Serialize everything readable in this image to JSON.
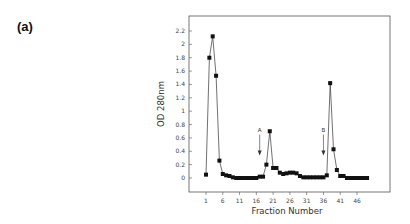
{
  "panel_label": "(a)",
  "chart_data": {
    "type": "line",
    "title": "",
    "xlabel": "Fraction Number",
    "ylabel": "OD 280nm",
    "ylim": [
      0,
      2.2
    ],
    "xlim": [
      1,
      49
    ],
    "grid": false,
    "legend": null,
    "marker": "square",
    "y_ticks": [
      "0",
      "0.2",
      "0.4",
      "0.6",
      "0.8",
      "1",
      "1.2",
      "1.4",
      "1.6",
      "1.8",
      "2",
      "2.2"
    ],
    "x_ticks": [
      "1",
      "6",
      "11",
      "16",
      "21",
      "26",
      "31",
      "36",
      "41",
      "46"
    ],
    "x": [
      1,
      2,
      3,
      4,
      5,
      6,
      7,
      8,
      9,
      10,
      11,
      12,
      13,
      14,
      15,
      16,
      17,
      18,
      19,
      20,
      21,
      22,
      23,
      24,
      25,
      26,
      27,
      28,
      29,
      30,
      31,
      32,
      33,
      34,
      35,
      36,
      37,
      38,
      39,
      40,
      41,
      42,
      43,
      44,
      45,
      46,
      47,
      48,
      49
    ],
    "series": [
      {
        "name": "OD 280nm",
        "values": [
          0.05,
          1.8,
          2.12,
          1.53,
          0.26,
          0.06,
          0.04,
          0.03,
          0.01,
          0.0,
          0.0,
          0.0,
          0.0,
          0.0,
          0.0,
          0.0,
          0.02,
          0.02,
          0.2,
          0.7,
          0.15,
          0.15,
          0.08,
          0.06,
          0.07,
          0.08,
          0.08,
          0.07,
          0.03,
          0.01,
          0.01,
          0.01,
          0.01,
          0.01,
          0.01,
          0.01,
          0.04,
          1.42,
          0.43,
          0.12,
          0.03,
          0.03,
          0.0,
          0.0,
          0.0,
          0.0,
          0.0,
          0.0,
          0.0
        ]
      }
    ],
    "annotations": [
      {
        "label": "A",
        "type": "down-arrow",
        "x": 17,
        "y_from": 0.65,
        "y_to": 0.35
      },
      {
        "label": "B",
        "type": "down-arrow",
        "x": 36,
        "y_from": 0.65,
        "y_to": 0.35
      }
    ]
  }
}
